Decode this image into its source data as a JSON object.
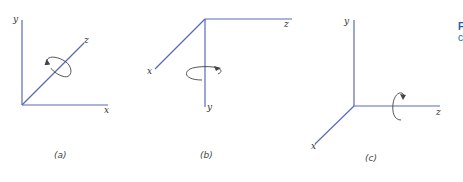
{
  "figure": {
    "caption_fragment_title": "F",
    "caption_fragment_sub": "c",
    "accent_color": "#1f5fa8",
    "axis_color": "#5a6ab8"
  },
  "panels": [
    {
      "id": "a",
      "caption": "(a)",
      "axes": {
        "x": "x",
        "y": "y",
        "z": "z"
      },
      "rotation_about": "z"
    },
    {
      "id": "b",
      "caption": "(b)",
      "axes": {
        "x": "x",
        "y": "y",
        "z": "z"
      },
      "rotation_about": "y"
    },
    {
      "id": "c",
      "caption": "(c)",
      "axes": {
        "x": "x",
        "y": "y",
        "z": "z"
      },
      "rotation_about": "z"
    }
  ]
}
